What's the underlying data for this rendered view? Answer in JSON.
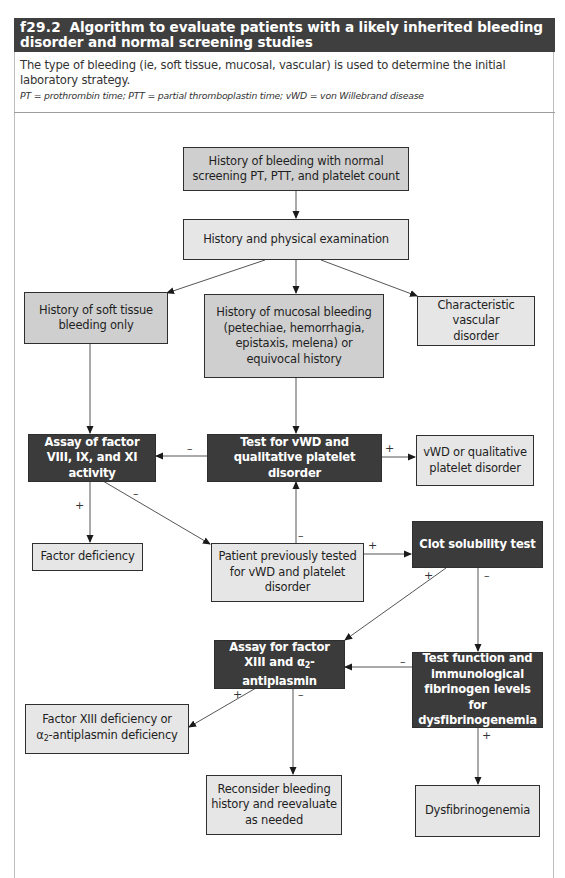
{
  "figure": {
    "number": "f29.2",
    "title": "Algorithm to evaluate patients with a likely inherited bleeding disorder and normal screening studies",
    "caption": "The type of bleeding (ie, soft tissue, mucosal, vascular) is used to determine the initial laboratory strategy.",
    "abbreviations": "PT = prothrombin time; PTT = partial thromboplastin time; vWD = von Willebrand disease"
  },
  "nodes": {
    "start": "History of bleeding with normal screening PT, PTT, and platelet count",
    "history_exam": "History and physical examination",
    "soft_tissue": "History of soft tissue bleeding only",
    "mucosal": "History of mucosal bleeding (petechiae, hemorrhagia, epistaxis, melena) or equivocal history",
    "vascular": "Characteristic vascular disorder",
    "assay_viii": "Assay of factor VIII, IX, and XI activity",
    "test_vwd": "Test for vWD and qualitative platelet disorder",
    "vwd_result": "vWD or qualitative platelet disorder",
    "factor_deficiency": "Factor deficiency",
    "previously_tested": "Patient previously tested for vWD and platelet disorder",
    "clot_solubility": "Clot solubility test",
    "assay_xiii_pre": "Assay for factor XIII and ",
    "alpha": "α",
    "two": "2",
    "antiplasmin": "-antiplasmin",
    "test_fibrinogen": "Test function and immunological fibrinogen levels for dysfibrinogenemia",
    "xiii_def_line1": "Factor XIII deficiency or",
    "xiii_def_line2": "-antiplasmin deficiency",
    "reconsider": "Reconsider bleeding history and reevaluate as needed",
    "dysfibrinogenemia": "Dysfibrinogenemia"
  },
  "edge_labels": {
    "plus": "+",
    "minus": "–"
  },
  "colors": {
    "header_bg": "#3f3f3f",
    "dark_box": "#3b3b3b",
    "mid_box": "#cfcfcf",
    "light_box": "#e6e6e6"
  }
}
